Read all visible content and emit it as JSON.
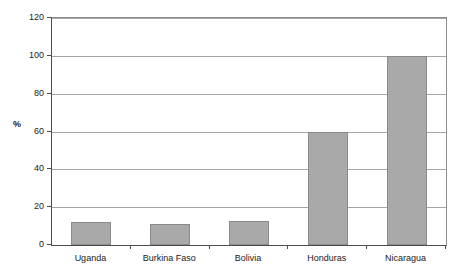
{
  "chart_data": {
    "type": "bar",
    "title": "",
    "subtitle": "",
    "xlabel": "",
    "ylabel": "%",
    "categories": [
      "Uganda",
      "Burkina Faso",
      "Bolivia",
      "Honduras",
      "Nicaragua"
    ],
    "values": [
      12,
      11,
      12.5,
      60,
      100
    ],
    "ylim": [
      0,
      120
    ],
    "ytick_labels": [
      "0",
      "20",
      "40",
      "60",
      "80",
      "100",
      "120"
    ],
    "ytick_values": [
      0,
      20,
      40,
      60,
      80,
      100,
      120
    ],
    "grid": "horizontal",
    "legend": "none",
    "series": [
      {
        "name": "",
        "values": [
          12,
          11,
          12.5,
          60,
          100
        ]
      }
    ],
    "colors": {
      "bar_fill": "#a9a9a9",
      "bar_border": "#8a8a8a",
      "gridline": "#a6a6a6",
      "axis": "#4d4d4d",
      "text": "#1a1a1a",
      "background": "#ffffff"
    }
  }
}
